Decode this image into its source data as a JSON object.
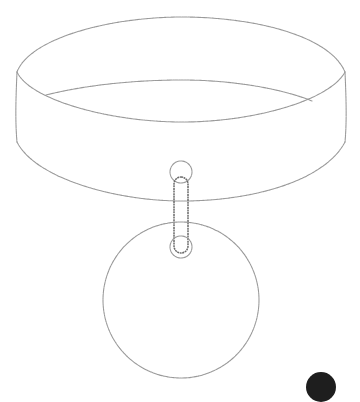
{
  "image": {
    "subject": "pencil line sketch of a collar with a round hanging tag",
    "colors": {
      "background": "#ffffff",
      "stroke": "#9a9a9a",
      "ring_stroke": "#6a6a6a",
      "corner_mark": "#1e1e1e"
    },
    "parts": [
      {
        "name": "collar-band",
        "label": "Collar band"
      },
      {
        "name": "ring",
        "label": "D-ring connector"
      },
      {
        "name": "tag",
        "label": "Round tag"
      }
    ]
  }
}
